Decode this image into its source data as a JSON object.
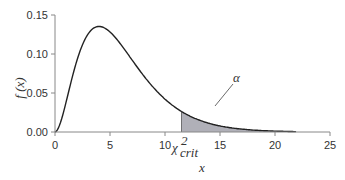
{
  "chart_data": {
    "type": "line",
    "title": "",
    "xlabel": "x",
    "ylabel": "f (x)",
    "xlim": [
      0,
      25
    ],
    "ylim": [
      0,
      0.15
    ],
    "x_ticks": [
      "0",
      "5",
      "10",
      "15",
      "20",
      "25"
    ],
    "y_ticks": [
      "0.00",
      "0.05",
      "0.10",
      "0.15"
    ],
    "grid": false,
    "series": [
      {
        "name": "chi-square density (df = 6)",
        "x": [
          0,
          1,
          2,
          3,
          4,
          5,
          6,
          7,
          8,
          9,
          10,
          11,
          12,
          13,
          14,
          15,
          16,
          17,
          18,
          19,
          20,
          21,
          22
        ],
        "values": [
          0.0,
          0.038,
          0.092,
          0.126,
          0.135,
          0.128,
          0.112,
          0.092,
          0.073,
          0.056,
          0.042,
          0.031,
          0.022,
          0.016,
          0.011,
          0.008,
          0.005,
          0.004,
          0.002,
          0.002,
          0.001,
          0.001,
          0.0005
        ]
      }
    ],
    "shaded_region": {
      "from": 11.5,
      "to": 22,
      "color": "#b0b0b8",
      "label": "α"
    },
    "annotations": [
      {
        "text": "α",
        "x": 13.5,
        "y": 0.04
      },
      {
        "text": "χ²crit",
        "x": 11.5,
        "y": 0.0
      }
    ]
  },
  "labels": {
    "ylabel": "f (x)",
    "xlabel": "x",
    "alpha": "α",
    "chi": "χ",
    "chi_sup": "2",
    "chi_sub": "crit",
    "xticks": [
      "0",
      "5",
      "10",
      "15",
      "20",
      "25"
    ],
    "yticks": [
      "0.00",
      "0.05",
      "0.10",
      "0.15"
    ]
  }
}
